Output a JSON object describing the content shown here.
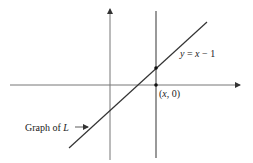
{
  "diagram": {
    "labels": {
      "equation": "y = x − 1",
      "equation_parts": {
        "y": "y",
        "eq": " = ",
        "x": "x",
        "rest": " − 1"
      },
      "point": "(x, 0)",
      "point_parts": {
        "open": "(",
        "x": "x",
        "rest": ", 0)"
      },
      "graph": "Graph of L",
      "graph_parts": {
        "text": "Graph of ",
        "L": "L"
      }
    },
    "colors": {
      "line": "#333333",
      "axis": "#777777",
      "vertical": "#555555"
    }
  }
}
